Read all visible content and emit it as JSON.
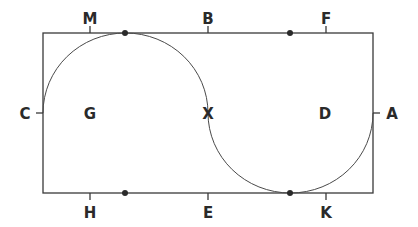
{
  "diagram": {
    "stroke_color": "#3a3a3a",
    "labels": {
      "M": "M",
      "B": "B",
      "F": "F",
      "C": "C",
      "G": "G",
      "X": "X",
      "D": "D",
      "A": "A",
      "H": "H",
      "E": "E",
      "K": "K"
    }
  }
}
